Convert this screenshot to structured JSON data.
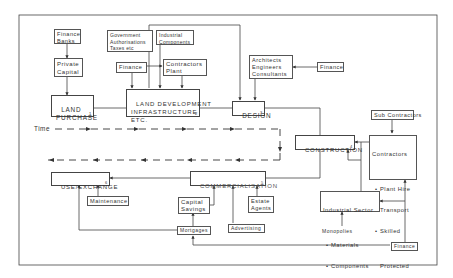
{
  "diagram": {
    "time_label": "Time",
    "main_stages": [
      {
        "id": "land_purchase",
        "label": "LAND\nPURCHASE",
        "number": "1"
      },
      {
        "id": "land_development",
        "label": "LAND DEVELOPMENT\nINFRASTRUCTURE\nETC.",
        "number": "2"
      },
      {
        "id": "design",
        "label": "DESIGN",
        "number": "3"
      },
      {
        "id": "construction",
        "label": "CONSTRUCTION",
        "number": "4"
      },
      {
        "id": "commercialisation",
        "label": "COMMERCIALISATION",
        "number": "5"
      },
      {
        "id": "use_exchange",
        "label": "USE/EXCHANGE",
        "number": "6"
      }
    ],
    "inputs": {
      "finance_banks": "Finance\nBanks",
      "private_capital": "Private\nCapital",
      "government": "Government\nAuthorisations\nTaxes etc",
      "industrial_components": "Industrial\nComponents",
      "finance_dev": "Finance",
      "contractors_plant": "Contractors\nPlant",
      "architects": "Architects\nEngineers\nConsultants",
      "finance_design": "Finance",
      "sub_contractors": "Sub Contractors",
      "contractors_title": "Contractors",
      "contractors_items": [
        "Plant Hire",
        "Transport",
        "Skilled",
        "Protected",
        "Labour"
      ],
      "industrial_sector_title": "Industrial Sector",
      "industrial_sector_items": [
        "Materials",
        "Components"
      ],
      "monopolies": "Monopolies",
      "finance_bottom": "Finance",
      "maintenance": "Maintenance",
      "capital_savings": "Capital\nSavings",
      "estate_agents": "Estate\nAgents",
      "advertising": "Advertising",
      "mortgages": "Mortgages"
    }
  }
}
